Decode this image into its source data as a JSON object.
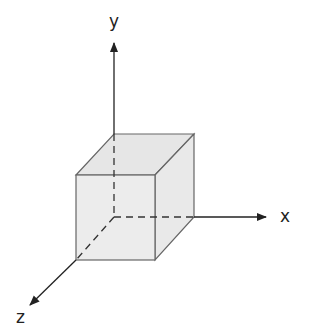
{
  "diagram": {
    "axes": {
      "x": {
        "label": "x"
      },
      "y": {
        "label": "y"
      },
      "z": {
        "label": "z"
      }
    },
    "colors": {
      "cube_fill": "#ebebeb",
      "stroke": "#555555",
      "axis": "#222222"
    }
  }
}
